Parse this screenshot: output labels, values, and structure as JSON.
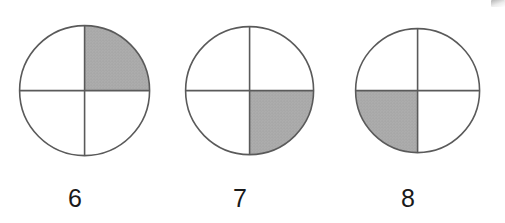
{
  "page": {
    "background_color": "#ffffff",
    "width": 505,
    "height": 223,
    "corner_mark_name": "scan-edge-smudge"
  },
  "style": {
    "stroke_color": "#5a5a5a",
    "stroke_width": 1.6,
    "shade_color": "#b0b0b0",
    "shade_stipple_color": "#8f8f8f",
    "label_color": "#1a1a1a",
    "label_font_size": "25px"
  },
  "figures": [
    {
      "label": "6",
      "shaded_quadrant": "top-right",
      "shaded_fraction": "1/4",
      "total_parts": 4,
      "shaded_parts": 1,
      "center": {
        "x": 83,
        "y": 89
      },
      "radius": 65,
      "label_x": 75,
      "label_y": 186,
      "divider_lines": [
        "vertical-diameter",
        "horizontal-diameter"
      ]
    },
    {
      "label": "7",
      "shaded_quadrant": "bottom-right",
      "shaded_fraction": "1/4",
      "total_parts": 4,
      "shaded_parts": 1,
      "center": {
        "x": 248,
        "y": 89
      },
      "radius": 64,
      "label_x": 240,
      "label_y": 186,
      "divider_lines": [
        "vertical-diameter",
        "horizontal-diameter"
      ]
    },
    {
      "label": "8",
      "shaded_quadrant": "bottom-left",
      "shaded_fraction": "1/4",
      "total_parts": 4,
      "shaded_parts": 1,
      "center": {
        "x": 416,
        "y": 89
      },
      "radius": 62,
      "label_x": 408,
      "label_y": 186,
      "divider_lines": [
        "vertical-diameter",
        "horizontal-diameter"
      ]
    }
  ]
}
